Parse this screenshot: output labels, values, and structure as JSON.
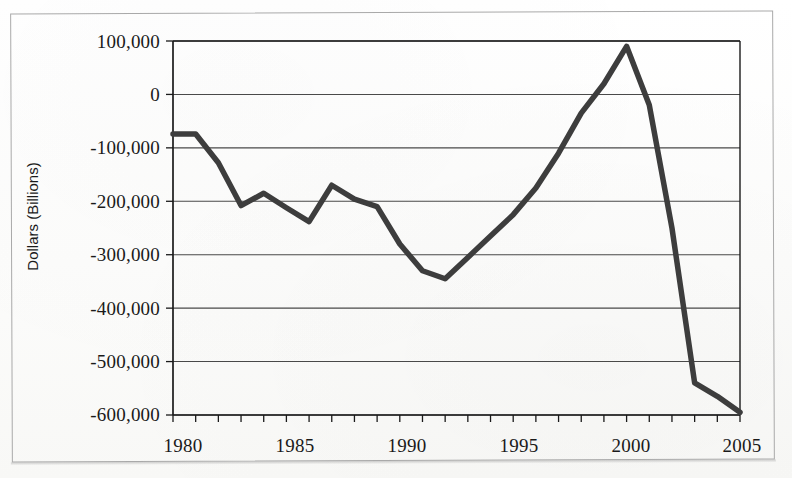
{
  "figure": {
    "y_axis_title": "Dollars (Billions)",
    "border_color": "#a9a9a9",
    "line_color": "#3d3d3d",
    "grid_color": "#2b2b2b",
    "axis_color": "#1a1a1a",
    "background": "#fdfdfc"
  },
  "axes": {
    "y_ticks": [
      {
        "value": 100000,
        "label": "100,000"
      },
      {
        "value": 0,
        "label": "0"
      },
      {
        "value": -100000,
        "label": "-100,000"
      },
      {
        "value": -200000,
        "label": "-200,000"
      },
      {
        "value": -300000,
        "label": "-300,000"
      },
      {
        "value": -400000,
        "label": "-400,000"
      },
      {
        "value": -500000,
        "label": "-500,000"
      },
      {
        "value": -600000,
        "label": "-600,000"
      }
    ],
    "x_ticks": [
      {
        "value": 1980,
        "label": "1980"
      },
      {
        "value": 1985,
        "label": "1985"
      },
      {
        "value": 1990,
        "label": "1990"
      },
      {
        "value": 1995,
        "label": "1995"
      },
      {
        "value": 2000,
        "label": "2000"
      },
      {
        "value": 2005,
        "label": "2005"
      }
    ],
    "x_minor_tick_interval": 1
  },
  "chart_data": {
    "type": "line",
    "title": "",
    "subtitle": "",
    "xlabel": "",
    "ylabel": "Dollars (Billions)",
    "xlim": [
      1980,
      2005
    ],
    "ylim": [
      -600000,
      100000
    ],
    "grid": true,
    "grid_axis": "y",
    "legend": false,
    "legend_position": "none",
    "x": [
      1980,
      1981,
      1982,
      1983,
      1984,
      1985,
      1986,
      1987,
      1988,
      1989,
      1990,
      1991,
      1992,
      1993,
      1994,
      1995,
      1996,
      1997,
      1998,
      1999,
      2000,
      2001,
      2002,
      2003,
      2004,
      2005
    ],
    "series": [
      {
        "name": "Budget surplus/deficit",
        "values": [
          -74000,
          -74000,
          -128000,
          -208000,
          -185000,
          -212000,
          -238000,
          -170000,
          -196000,
          -210000,
          -280000,
          -330000,
          -345000,
          -305000,
          -265000,
          -225000,
          -175000,
          -110000,
          -35000,
          20000,
          90000,
          -20000,
          -250000,
          -540000,
          -565000,
          -595000
        ]
      }
    ]
  }
}
